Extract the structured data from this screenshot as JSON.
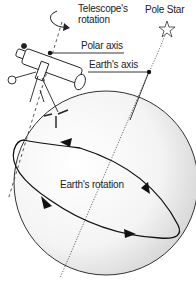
{
  "diagram": {
    "labels": {
      "telescope_rotation_line1": "Telescope's",
      "telescope_rotation_line2": "rotation",
      "pole_star": "Pole Star",
      "polar_axis": "Polar axis",
      "earths_axis": "Earth's axis",
      "earths_rotation": "Earth's rotation"
    },
    "colors": {
      "line": "#222222",
      "globe_shade": "#d8d8d8",
      "background": "#ffffff"
    }
  }
}
